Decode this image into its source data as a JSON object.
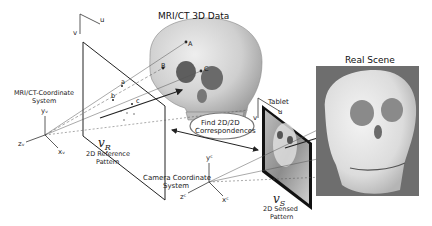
{
  "titles": {
    "mri_ct": "MRI/CT 3D Data",
    "real_scene": "Real Scene",
    "tablet": "Tablet"
  },
  "coordinate_systems": {
    "mri_ct": {
      "label_line1": "MRI/CT-Coordinate",
      "label_line2": "System",
      "x": "xᵥ",
      "y": "yᵥ",
      "z": "zᵥ"
    },
    "camera": {
      "label_line1": "Camera Coordinate",
      "label_line2": "System",
      "x": "xᶜ",
      "y": "yᶜ",
      "z": "zᶜ"
    }
  },
  "reference_pattern": {
    "symbol": "𝑣",
    "subscript": "R",
    "label_line1": "2D Reference",
    "label_line2": "Pattern",
    "u": "u",
    "v": "v",
    "points": [
      "a",
      "b",
      "c"
    ]
  },
  "sensed_pattern": {
    "symbol": "𝑣",
    "subscript": "S",
    "label_line1": "2D Sensed",
    "label_line2": "Pattern",
    "u": "u",
    "v": "v"
  },
  "skull_points": [
    "A",
    "B",
    "C"
  ],
  "correspondence": {
    "line1": "Find 2D/2D",
    "line2": "Correspondences"
  },
  "colors": {
    "line": "#2a2a2a",
    "skull_light": "#d9d9d9",
    "skull_dark": "#8a8a8a",
    "photo_bg": "#6e6e6e",
    "photo_skull": "#e6e6e6"
  }
}
